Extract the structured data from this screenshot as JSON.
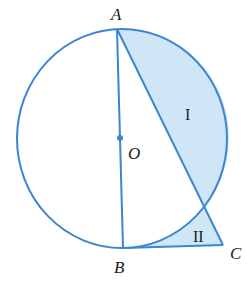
{
  "diagram": {
    "type": "geometry",
    "colors": {
      "stroke": "#3a86d0",
      "fill": "#cfe6f7",
      "text": "#1a1a1a"
    },
    "points": {
      "A": {
        "label": "A",
        "x": 117,
        "y": 29
      },
      "B": {
        "label": "B",
        "x": 123,
        "y": 248
      },
      "O": {
        "label": "O",
        "x": 120,
        "y": 138
      },
      "C": {
        "label": "C",
        "x": 223,
        "y": 245
      },
      "D": {
        "x": 205,
        "y": 207
      }
    },
    "regions": [
      {
        "id": "I",
        "label": "I",
        "description": "Region between chord AD and arc AD (right side)"
      },
      {
        "id": "II",
        "label": "II",
        "description": "Region bounded by arc BD, segment DC and segment BC"
      }
    ]
  }
}
